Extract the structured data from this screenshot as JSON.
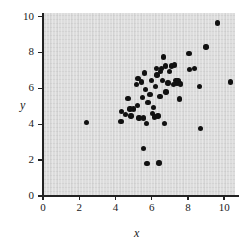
{
  "chart_data": {
    "type": "scatter",
    "title": "",
    "xlabel": "x",
    "ylabel": "y",
    "xlim": [
      0,
      10.6
    ],
    "ylim": [
      0,
      10.2
    ],
    "xticks": [
      0,
      2,
      4,
      6,
      8,
      10
    ],
    "yticks": [
      0,
      2,
      4,
      6,
      8,
      10
    ],
    "xtick_labels": [
      "0",
      "2",
      "4",
      "6",
      "8",
      "10"
    ],
    "ytick_labels": [
      "0",
      "2",
      "4",
      "6",
      "8",
      "10"
    ],
    "grid": false,
    "legend": null,
    "marker": "filled-circle",
    "marker_color": "#111111",
    "plot_background": "#dddddd",
    "points": [
      [
        2.4,
        4.1
      ],
      [
        4.3,
        4.15
      ],
      [
        4.35,
        4.7
      ],
      [
        4.55,
        4.55
      ],
      [
        4.7,
        5.45
      ],
      [
        4.8,
        4.85
      ],
      [
        4.85,
        4.45
      ],
      [
        5.0,
        4.85
      ],
      [
        5.15,
        6.2
      ],
      [
        5.2,
        5.05
      ],
      [
        5.25,
        6.55
      ],
      [
        5.3,
        4.35
      ],
      [
        5.45,
        6.35
      ],
      [
        5.5,
        5.5
      ],
      [
        5.55,
        4.35
      ],
      [
        5.55,
        2.65
      ],
      [
        5.6,
        6.85
      ],
      [
        5.65,
        5.95
      ],
      [
        5.7,
        4.05
      ],
      [
        5.75,
        1.8
      ],
      [
        5.8,
        5.2
      ],
      [
        5.9,
        5.65
      ],
      [
        6.0,
        6.45
      ],
      [
        6.05,
        4.6
      ],
      [
        6.1,
        4.95
      ],
      [
        6.15,
        4.4
      ],
      [
        6.2,
        6.1
      ],
      [
        6.25,
        7.1
      ],
      [
        6.3,
        6.75
      ],
      [
        6.35,
        4.45
      ],
      [
        6.4,
        1.85
      ],
      [
        6.45,
        5.55
      ],
      [
        6.5,
        6.95
      ],
      [
        6.55,
        7.1
      ],
      [
        6.6,
        6.45
      ],
      [
        6.65,
        7.75
      ],
      [
        6.7,
        4.05
      ],
      [
        6.75,
        7.25
      ],
      [
        6.8,
        5.8
      ],
      [
        6.9,
        6.3
      ],
      [
        7.0,
        6.95
      ],
      [
        7.1,
        7.25
      ],
      [
        7.2,
        6.2
      ],
      [
        7.25,
        7.3
      ],
      [
        7.35,
        6.45
      ],
      [
        7.4,
        6.3
      ],
      [
        7.45,
        6.4
      ],
      [
        7.55,
        5.4
      ],
      [
        7.6,
        6.25
      ],
      [
        8.05,
        7.95
      ],
      [
        8.1,
        7.05
      ],
      [
        8.35,
        7.1
      ],
      [
        8.65,
        6.1
      ],
      [
        8.7,
        3.75
      ],
      [
        9.0,
        8.3
      ],
      [
        9.65,
        9.65
      ],
      [
        10.35,
        6.35
      ]
    ]
  }
}
